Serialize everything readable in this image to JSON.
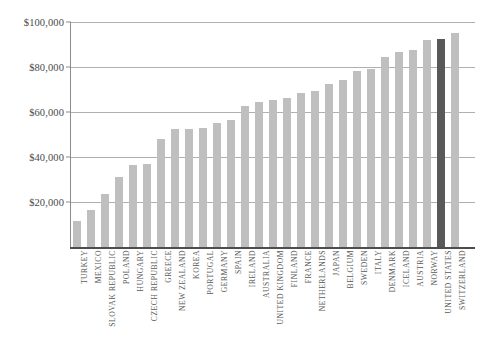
{
  "chart_data": {
    "type": "bar",
    "title": "",
    "subtitle": "",
    "xlabel": "",
    "ylabel": "",
    "ylim": [
      0,
      100000
    ],
    "ytick_values": [
      20000,
      40000,
      60000,
      80000,
      100000
    ],
    "ytick_labels": [
      "$20,000",
      "$40,000",
      "$60,000",
      "$80,000",
      "$100,000"
    ],
    "grid": true,
    "legend": "none",
    "orientation": "vertical",
    "sorted": "ascending",
    "highlight_category": "UNITED STATES",
    "categories": [
      "TURKEY",
      "MEXICO",
      "SLOVAK REPUBLIC",
      "POLAND",
      "HUNGARY",
      "CZECH REPUBLIC",
      "GREECE",
      "NEW ZEALAND",
      "KOREA",
      "PORTUGAL",
      "GERMANY",
      "SPAIN",
      "IRELAND",
      "AUSTRALIA",
      "UNITED KINGDOM",
      "FINLAND",
      "FRANCE",
      "NETHERLANDS",
      "JAPAN",
      "BELGIUM",
      "SWEDEN",
      "ITALY",
      "DENMARK",
      "ICELAND",
      "AUSTRIA",
      "NORWAY",
      "UNITED STATES",
      "SWITZERLAND"
    ],
    "values": [
      12000,
      16900,
      24000,
      31500,
      36900,
      37300,
      48400,
      52900,
      53000,
      53300,
      55700,
      56700,
      63100,
      64800,
      65800,
      66500,
      69100,
      70000,
      72700,
      74800,
      78700,
      79600,
      84700,
      87000,
      88100,
      92500,
      92800,
      95700
    ],
    "colors": {
      "bar": "#bfbfbf",
      "bar_highlight": "#595959",
      "gridline": "#b0b0b0",
      "axis": "#8c8c8c",
      "baseline": "#4d4d4d",
      "label_text": "#585858",
      "tick_text": "#4a4a4a",
      "background": "#ffffff"
    }
  }
}
